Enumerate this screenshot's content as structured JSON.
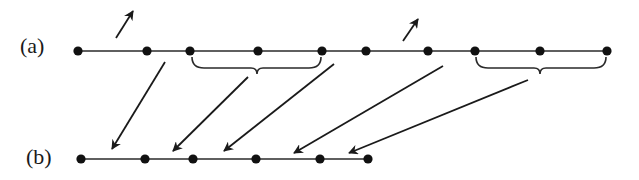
{
  "diagram": {
    "colors": {
      "ink": "#1a1a1a",
      "background": "#ffffff"
    },
    "rows": [
      {
        "id": "a",
        "label": "(a)",
        "label_pos": [
          20,
          53
        ],
        "y": 51,
        "dots_x": [
          78,
          147,
          190,
          258,
          322,
          366,
          428,
          475,
          540,
          607
        ]
      },
      {
        "id": "b",
        "label": "(b)",
        "label_pos": [
          26,
          164
        ],
        "y": 159,
        "dots_x": [
          81,
          145,
          193,
          256,
          320,
          368
        ]
      }
    ],
    "up_arrows": [
      {
        "from": [
          116,
          38
        ],
        "to": [
          133,
          11
        ]
      },
      {
        "from": [
          403,
          41
        ],
        "to": [
          418,
          19
        ]
      }
    ],
    "braces": [
      {
        "x1": 192,
        "x2": 321,
        "y": 60,
        "tip_x": 257,
        "depth": 14
      },
      {
        "x1": 476,
        "x2": 606,
        "y": 60,
        "tip_x": 540,
        "depth": 14
      }
    ],
    "mapping_arrows": [
      {
        "from": [
          165,
          62
        ],
        "to": [
          112,
          149
        ]
      },
      {
        "from": [
          248,
          77
        ],
        "to": [
          173,
          151
        ]
      },
      {
        "from": [
          334,
          64
        ],
        "to": [
          224,
          151
        ]
      },
      {
        "from": [
          443,
          66
        ],
        "to": [
          294,
          153
        ]
      },
      {
        "from": [
          528,
          80
        ],
        "to": [
          349,
          153
        ]
      }
    ]
  }
}
